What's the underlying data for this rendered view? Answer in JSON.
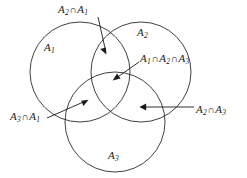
{
  "figure": {
    "background_color": "#ffffff",
    "stroke_color": "#2b2b2b"
  },
  "sets": [
    {
      "id": "A1",
      "label": "A",
      "subscript": "1",
      "cx": 80,
      "cy": 72,
      "r": 50
    },
    {
      "id": "A2",
      "label": "A",
      "subscript": "2",
      "cx": 141,
      "cy": 72,
      "r": 50
    },
    {
      "id": "A3",
      "label": "A",
      "subscript": "3",
      "cx": 115,
      "cy": 122,
      "r": 50
    }
  ],
  "set_labels": {
    "a1": {
      "base": "A",
      "sub": "1",
      "x": 44,
      "y": 42
    },
    "a2": {
      "base": "A",
      "sub": "2",
      "x": 137,
      "y": 27
    },
    "a3": {
      "base": "A",
      "sub": "3",
      "x": 108,
      "y": 150
    }
  },
  "intersection_labels": {
    "a2_a1": {
      "text": "A2 ∩ A1",
      "parts": [
        "A",
        "2",
        "∩",
        "A",
        "1"
      ],
      "x": 58,
      "y": 4
    },
    "a1_a2_a3": {
      "text": "A1 ∩ A2 ∩ A3",
      "parts": [
        "A",
        "1",
        "∩",
        "A",
        "2",
        "∩",
        "A",
        "3"
      ],
      "x": 140,
      "y": 53
    },
    "a3_a1": {
      "text": "A3 ∩ A1",
      "parts": [
        "A",
        "3",
        "∩",
        "A",
        "1"
      ],
      "x": 10,
      "y": 111
    },
    "a2_a3": {
      "text": "A2 ∩ A3",
      "parts": [
        "A",
        "2",
        "∩",
        "A",
        "3"
      ],
      "x": 196,
      "y": 104
    }
  },
  "operator_symbol": "∩",
  "annotations": [
    {
      "name": "arrow-a2-a1",
      "from_x": 98,
      "from_y": 17,
      "to_x": 106,
      "to_y": 53
    },
    {
      "name": "arrow-a1-a2-a3",
      "from_x": 139,
      "from_y": 62,
      "to_x": 113,
      "to_y": 80
    },
    {
      "name": "arrow-a3-a1",
      "from_x": 47,
      "from_y": 118,
      "to_x": 88,
      "to_y": 100
    },
    {
      "name": "arrow-a2-a3",
      "from_x": 194,
      "from_y": 107,
      "to_x": 140,
      "to_y": 107
    }
  ]
}
